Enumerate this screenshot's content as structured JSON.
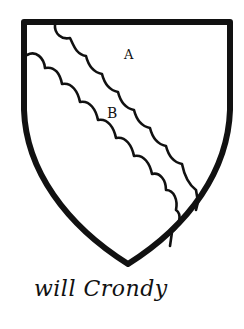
{
  "figure": {
    "type": "heraldic-shield",
    "colors": {
      "ink": "#111111",
      "paper": "#ffffff"
    }
  },
  "labels": {
    "field": "A",
    "bend": "B"
  },
  "caption": {
    "signature": "will Crondy"
  }
}
